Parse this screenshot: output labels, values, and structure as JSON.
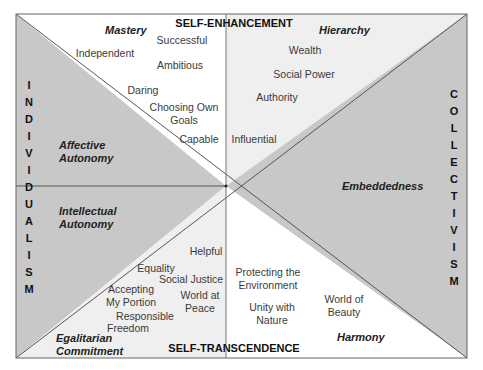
{
  "diagram": {
    "colors": {
      "dark_region": "#c8c8c8",
      "light_region": "#efefef",
      "white_region": "#ffffff",
      "line": "#555555"
    },
    "axes": {
      "top": "SELF-ENHANCEMENT",
      "bottom": "SELF-TRANSCENDENCE",
      "left": "INDIVIDUALISM",
      "right": "COLLECTIVISM"
    },
    "orientations": {
      "mastery": "Mastery",
      "hierarchy": "Hierarchy",
      "affective_autonomy": "Affective Autonomy",
      "intellectual_autonomy": "Intellectual Autonomy",
      "embeddedness": "Embeddedness",
      "egalitarian_commitment": "Egalitarian Commitment",
      "harmony": "Harmony"
    },
    "values": {
      "independent": "Independent",
      "successful": "Successful",
      "ambitious": "Ambitious",
      "daring": "Daring",
      "choosing_own_goals_1": "Choosing Own",
      "choosing_own_goals_2": "Goals",
      "capable": "Capable",
      "wealth": "Wealth",
      "social_power": "Social Power",
      "authority": "Authority",
      "influential": "Influential",
      "helpful": "Helpful",
      "equality": "Equality",
      "social_justice": "Social Justice",
      "accepting_my_portion_1": "Accepting",
      "accepting_my_portion_2": "My Portion",
      "world_at_peace_1": "World at",
      "world_at_peace_2": "Peace",
      "responsible": "Responsible",
      "freedom": "Freedom",
      "protecting_environment_1": "Protecting the",
      "protecting_environment_2": "Environment",
      "unity_with_nature_1": "Unity with",
      "unity_with_nature_2": "Nature",
      "world_of_beauty_1": "World of",
      "world_of_beauty_2": "Beauty"
    }
  }
}
